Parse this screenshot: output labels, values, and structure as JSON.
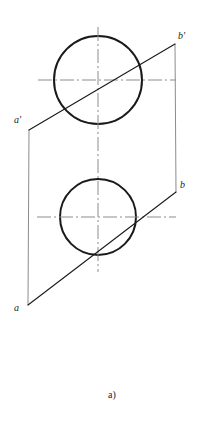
{
  "figure": {
    "caption": "a)",
    "caption_x": 108,
    "caption_y": 390,
    "background_color": "#ffffff",
    "ink_color": "#1a1a1a",
    "centerline_color": "#8c8c8c",
    "description_type": "descriptive-geometry-orthographic-projection"
  },
  "labels": [
    {
      "name": "a-prime",
      "text": "a′",
      "x": 14,
      "y": 115
    },
    {
      "name": "b-prime",
      "text": "b′",
      "x": 178,
      "y": 31
    },
    {
      "name": "b",
      "text": "b",
      "x": 180,
      "y": 180
    },
    {
      "name": "a",
      "text": "a",
      "x": 14,
      "y": 303
    }
  ],
  "geometry": {
    "top_circle": {
      "cx": 98,
      "cy": 80,
      "r": 44,
      "stroke_width": 2.0
    },
    "bottom_circle": {
      "cx": 98,
      "cy": 217,
      "r": 38,
      "stroke_width": 2.0
    },
    "plane_outline": {
      "a_prime": {
        "x": 29,
        "y": 130
      },
      "b_prime": {
        "x": 175,
        "y": 44
      },
      "b": {
        "x": 176,
        "y": 192
      },
      "a": {
        "x": 28,
        "y": 305
      },
      "edge_stroke_width": 1.0,
      "vertical_edge_color": "#8c8c8c"
    },
    "line_ab_front": {
      "x1": 29,
      "y1": 130,
      "x2": 175,
      "y2": 44,
      "stroke_width": 1.1
    },
    "line_ab_top": {
      "x1": 28,
      "y1": 305,
      "x2": 176,
      "y2": 192,
      "stroke_width": 1.1
    },
    "centerlines": {
      "vertical": {
        "x": 98,
        "y1": 27,
        "y2": 272
      },
      "horizontal_top": {
        "y": 80,
        "x1": 38,
        "x2": 176
      },
      "horizontal_bottom": {
        "y": 217,
        "x1": 37,
        "x2": 176
      },
      "dash_pattern": "14 3 2 3",
      "stroke_width": 1.0
    }
  }
}
